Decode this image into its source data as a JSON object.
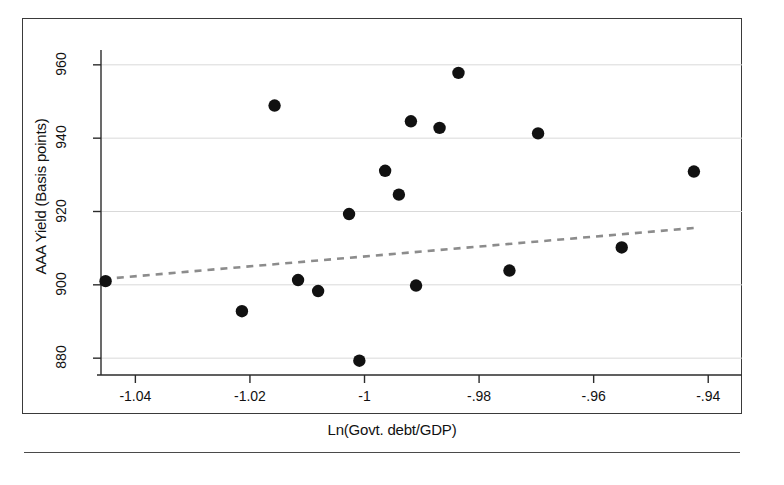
{
  "figure": {
    "type": "scatter-plot",
    "background_color": "#ffffff",
    "frame_color": "#3a3a3a",
    "marker_color": "#111111",
    "fit_line_color": "#8c8c8c",
    "gridline_color": "#d9d9d9"
  },
  "chart_data": {
    "type": "scatter",
    "title": "",
    "xlabel": "Ln(Govt. debt/GDP)",
    "ylabel": "AAA Yield (Basis points)",
    "xlim": [
      -1.046,
      -0.9355
    ],
    "ylim": [
      876.5,
      963.5
    ],
    "grid": true,
    "legend": false,
    "xticks": [
      -1.04,
      -1.02,
      -1,
      -0.98,
      -0.96,
      -0.94
    ],
    "xticklabels": [
      "-1.04",
      "-1.02",
      "-1",
      "-.98",
      "-.96",
      "-.94"
    ],
    "yticks": [
      880,
      900,
      920,
      940,
      960
    ],
    "yticklabels": [
      "880",
      "900",
      "920",
      "940",
      "960"
    ],
    "points": [
      {
        "x": -1.0452,
        "y": 901.0
      },
      {
        "x": -1.0214,
        "y": 892.8
      },
      {
        "x": -1.0157,
        "y": 948.9
      },
      {
        "x": -1.0116,
        "y": 901.3
      },
      {
        "x": -1.0081,
        "y": 898.3
      },
      {
        "x": -1.0027,
        "y": 919.3
      },
      {
        "x": -1.0009,
        "y": 879.3
      },
      {
        "x": -0.9964,
        "y": 931.1
      },
      {
        "x": -0.994,
        "y": 924.6
      },
      {
        "x": -0.9919,
        "y": 944.6
      },
      {
        "x": -0.991,
        "y": 899.8
      },
      {
        "x": -0.9869,
        "y": 942.8
      },
      {
        "x": -0.9836,
        "y": 957.8
      },
      {
        "x": -0.9747,
        "y": 903.9
      },
      {
        "x": -0.9697,
        "y": 941.3
      },
      {
        "x": -0.9551,
        "y": 910.2
      },
      {
        "x": -0.9425,
        "y": 930.9
      }
    ],
    "fit_line": {
      "style": "dashed",
      "x_start": -1.0455,
      "y_start": 901.6,
      "x_end": -0.9425,
      "y_end": 915.5
    }
  }
}
